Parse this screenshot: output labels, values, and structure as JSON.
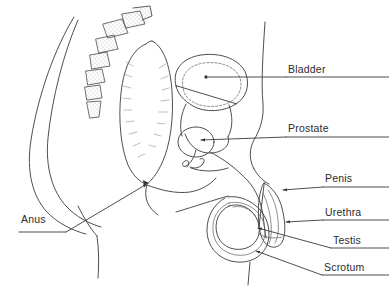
{
  "figure": {
    "style": "line-art anatomical drawing",
    "background_color": "#ffffff",
    "stroke_color": "#3a3a3a",
    "text_color": "#2b2b2b"
  },
  "labels": [
    {
      "id": "bladder",
      "text": "Bladder",
      "side": "right",
      "x": 288,
      "y": 63,
      "leader": "horizontal line from text left edge to dot marker inside bladder"
    },
    {
      "id": "prostate",
      "text": "Prostate",
      "side": "right",
      "x": 288,
      "y": 122,
      "leader": "horizontal line with arrowhead pointing left into prostate"
    },
    {
      "id": "penis",
      "text": "Penis",
      "side": "right",
      "x": 325,
      "y": 172,
      "leader": "horizontal line with arrowhead pointing left into penis shaft"
    },
    {
      "id": "urethra",
      "text": "Urethra",
      "side": "right",
      "x": 325,
      "y": 206,
      "leader": "horizontal line with arrowhead pointing left into urethra"
    },
    {
      "id": "testis",
      "text": "Testis",
      "side": "right",
      "x": 333,
      "y": 234,
      "leader": "diagonal line with arrowhead pointing up-left into testis"
    },
    {
      "id": "scrotum",
      "text": "Scrotum",
      "side": "right",
      "x": 324,
      "y": 261,
      "leader": "diagonal line with arrowhead pointing up-left into scrotum wall"
    },
    {
      "id": "anus",
      "text": "Anus",
      "side": "left",
      "x": 21,
      "y": 213,
      "leader": "diagonal line with arrowhead pointing up-right to anal canal"
    }
  ],
  "anatomy_parts": [
    "buttock-outline",
    "vertebral-column",
    "rectum",
    "bladder",
    "prostate",
    "vas-deferens",
    "penis",
    "urethra",
    "testis",
    "scrotum",
    "abdominal-wall"
  ]
}
